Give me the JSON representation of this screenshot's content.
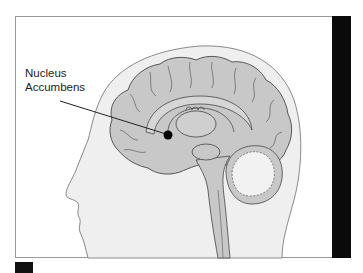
{
  "diagram": {
    "label": {
      "line1": "Nucleus",
      "line2": "Accumbens"
    },
    "colors": {
      "brain_fill": "#c8c8c8",
      "head_fill": "#efefef",
      "cerebellum_fill": "#f2f2f2",
      "outline": "#555555",
      "marker": "#000000",
      "side_bar": "#0a0a0a"
    }
  }
}
